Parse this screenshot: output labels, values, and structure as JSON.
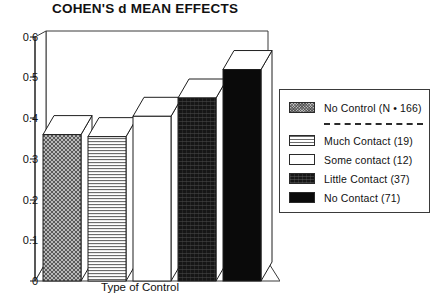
{
  "chart_data": {
    "type": "bar",
    "title": "COHEN'S d MEAN EFFECTS",
    "xlabel": "Type of Control",
    "ylabel": "",
    "grid": false,
    "legend_position": "right",
    "ylim": [
      0,
      0.6
    ],
    "yticks": [
      "0.6",
      "0.5",
      "0.4",
      "0.3",
      "0.2",
      "0.1",
      "0"
    ],
    "ytick_values": [
      0.6,
      0.5,
      0.4,
      0.3,
      0.2,
      0.1,
      0
    ],
    "categories": [
      "No Control (N = 166)",
      "Much Contact (19)",
      "Some contact (12)",
      "Little Contact (37)",
      "No Contact (71)"
    ],
    "values": [
      0.36,
      0.355,
      0.405,
      0.45,
      0.52
    ],
    "series": [
      {
        "name": "Cohen's d mean effect",
        "values": [
          0.36,
          0.355,
          0.405,
          0.45,
          0.52
        ]
      }
    ]
  },
  "chart": {
    "title": "COHEN'S d MEAN EFFECTS",
    "xlabel": "Type of Control",
    "yticks": [
      {
        "label": "0.6"
      },
      {
        "label": "0.5"
      },
      {
        "label": "0.4"
      },
      {
        "label": "0.3"
      },
      {
        "label": "0.2"
      },
      {
        "label": "0.1"
      },
      {
        "label": "0"
      }
    ]
  },
  "legend": {
    "entries": [
      {
        "label": "No Control (N • 166)",
        "swatch": "stipple-gray",
        "value": 0.36
      },
      {
        "label": "Much Contact  (19)",
        "swatch": "horizontal-lines",
        "value": 0.355
      },
      {
        "label": "Some contact  (12)",
        "swatch": "white",
        "value": 0.405
      },
      {
        "label": "Little Contact (37)",
        "swatch": "dark-speckle",
        "value": 0.45
      },
      {
        "label": "No Contact   (71)",
        "swatch": "solid-black",
        "value": 0.52
      }
    ],
    "separator_after_index": 0
  },
  "colors": {
    "axis": "#2a2a2a",
    "bar_outline": "#1f1f1f",
    "stipple_gray": "#b9b9b9",
    "dark_speckle": "#161616",
    "solid_black": "#0a0a0a",
    "background": "#ffffff"
  }
}
